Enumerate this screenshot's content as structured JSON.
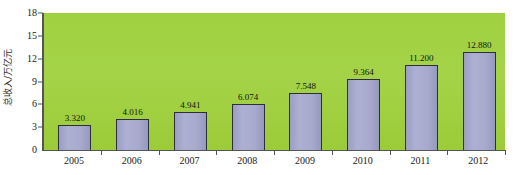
{
  "chart_data": {
    "type": "bar",
    "title": "",
    "xlabel": "",
    "ylabel": "总收入/万亿元",
    "categories": [
      "2005",
      "2006",
      "2007",
      "2008",
      "2009",
      "2010",
      "2011",
      "2012"
    ],
    "values": [
      3.32,
      4.016,
      4.941,
      6.074,
      7.548,
      9.364,
      11.2,
      12.88
    ],
    "value_labels": [
      "3.320",
      "4.016",
      "4.941",
      "6.074",
      "7.548",
      "9.364",
      "11.200",
      "12.880"
    ],
    "ylim": [
      0,
      18
    ],
    "yticks": [
      0,
      3,
      6,
      9,
      12,
      15,
      18
    ],
    "ytick_labels": [
      "0",
      "3",
      "6",
      "9",
      "12",
      "15",
      "18"
    ],
    "grid": false,
    "legend": null,
    "legend_position": "none",
    "series": [
      {
        "name": "总收入",
        "values": [
          3.32,
          4.016,
          4.941,
          6.074,
          7.548,
          9.364,
          11.2,
          12.88
        ]
      }
    ],
    "colors": {
      "plot_background": "#a2d243",
      "bar_fill": "#a7aacd",
      "bar_border": "#2e2e3a",
      "axis": "#555555",
      "text": "#1a1a1a",
      "page_background": "#ffffff"
    }
  }
}
